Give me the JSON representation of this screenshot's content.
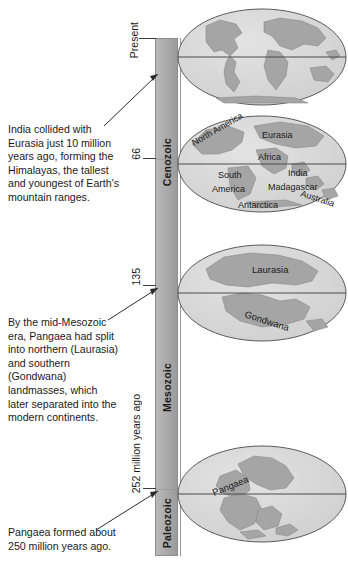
{
  "diagram": {
    "axis_caption": "252 million years ago",
    "colors": {
      "era_bar": "#ababab",
      "ocean": "#d8d8d8",
      "land": "#a8a8a8",
      "land_shadow": "#8f8f8f",
      "outline": "#5a5a5a",
      "text": "#1a1a1a"
    }
  },
  "axis": {
    "ticks": [
      {
        "label": "Present",
        "value": "Present"
      },
      {
        "label": "66",
        "value": "66"
      },
      {
        "label": "135",
        "value": "135"
      },
      {
        "label": "252",
        "value": "252"
      }
    ]
  },
  "eras": [
    {
      "name": "Cenozoic",
      "label": "Cenozoic"
    },
    {
      "name": "Mesozoic",
      "label": "Mesozoic"
    },
    {
      "name": "Paleozoic",
      "label": "Paleozoic"
    }
  ],
  "globes": [
    {
      "id": "globe-present",
      "era": "Cenozoic",
      "labels": []
    },
    {
      "id": "globe-66",
      "era": "Cenozoic",
      "labels": [
        "North America",
        "Eurasia",
        "Africa",
        "South America",
        "India",
        "Madagascar",
        "Australia",
        "Antarctica"
      ]
    },
    {
      "id": "globe-135",
      "era": "Mesozoic",
      "labels": [
        "Laurasia",
        "Gondwana"
      ]
    },
    {
      "id": "globe-252",
      "era": "Paleozoic",
      "labels": [
        "Pangaea"
      ]
    }
  ],
  "notes": [
    {
      "id": "note-cenozoic",
      "text": "India collided with Eurasia just 10 million years ago, forming the Himalayas, the tallest and youngest of Earth's mountain ranges."
    },
    {
      "id": "note-mesozoic",
      "text": "By the mid-Mesozoic era, Pangaea had split into northern (Laurasia) and southern (Gondwana) landmasses, which later separated into the modern continents."
    },
    {
      "id": "note-paleozoic",
      "text": "Pangaea formed about 250 million years ago."
    }
  ],
  "globe_labels": {
    "north_america": "North America",
    "eurasia": "Eurasia",
    "africa": "Africa",
    "south": "South",
    "america": "America",
    "india": "India",
    "madagascar": "Madagascar",
    "australia": "Australia",
    "antarctica": "Antarctica",
    "laurasia": "Laurasia",
    "gondwana": "Gondwana",
    "pangaea": "Pangaea"
  }
}
